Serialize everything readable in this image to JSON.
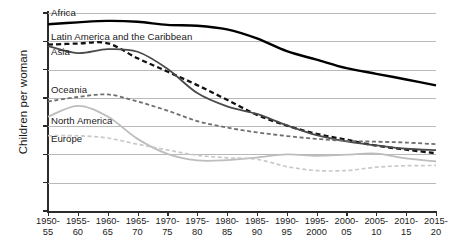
{
  "chart_data": {
    "type": "line",
    "title": "",
    "xlabel": "",
    "ylabel": "Children per woman",
    "ylim": [
      0,
      7
    ],
    "yticks": [
      0,
      1,
      2,
      3,
      4,
      5,
      6,
      7
    ],
    "grid": true,
    "legend_position": "inline-labels",
    "categories": [
      "1950-55",
      "1955-60",
      "1960-65",
      "1965-70",
      "1970-75",
      "1975-80",
      "1980-85",
      "1985-90",
      "1990-95",
      "1995-2000",
      "2000-05",
      "2005-10",
      "2010-15",
      "2015-20"
    ],
    "category_lines": [
      [
        "1950-",
        "55"
      ],
      [
        "1955-",
        "60"
      ],
      [
        "1960-",
        "65"
      ],
      [
        "1965-",
        "70"
      ],
      [
        "1970-",
        "75"
      ],
      [
        "1975-",
        "80"
      ],
      [
        "1980-",
        "85"
      ],
      [
        "1985-",
        "90"
      ],
      [
        "1990-",
        "95"
      ],
      [
        "1995-",
        "2000"
      ],
      [
        "2000-",
        "05"
      ],
      [
        "2005-",
        "10"
      ],
      [
        "2010-",
        "15"
      ],
      [
        "2015-",
        "20"
      ]
    ],
    "series": [
      {
        "name": "Africa",
        "style": "solid",
        "color": "#000000",
        "width": 2.4,
        "values": [
          6.6,
          6.67,
          6.72,
          6.69,
          6.58,
          6.55,
          6.42,
          6.1,
          5.65,
          5.35,
          5.05,
          4.85,
          4.65,
          4.44
        ],
        "label_x": 1,
        "label_y": 6.96
      },
      {
        "name": "Latin America and the Caribbean",
        "style": "dashed",
        "color": "#111111",
        "width": 2.3,
        "values": [
          5.88,
          5.92,
          5.93,
          5.4,
          4.93,
          4.45,
          3.93,
          3.4,
          3.02,
          2.73,
          2.52,
          2.31,
          2.17,
          2.04
        ],
        "label_x": 1,
        "label_y": 6.1
      },
      {
        "name": "Asia",
        "style": "solid",
        "color": "#4a4a4a",
        "width": 1.8,
        "values": [
          5.83,
          5.58,
          5.72,
          5.63,
          5.03,
          4.17,
          3.7,
          3.43,
          3.03,
          2.68,
          2.46,
          2.32,
          2.2,
          2.15
        ],
        "label_x": 1,
        "label_y": 5.58
      },
      {
        "name": "Oceania",
        "style": "dashed",
        "color": "#6f6f6f",
        "width": 1.8,
        "values": [
          3.87,
          4.03,
          4.12,
          3.87,
          3.55,
          3.18,
          2.95,
          2.78,
          2.65,
          2.55,
          2.48,
          2.45,
          2.42,
          2.36
        ],
        "label_x": 1,
        "label_y": 4.26
      },
      {
        "name": "North America",
        "style": "solid",
        "color": "#bdbdbd",
        "width": 1.8,
        "values": [
          3.33,
          3.72,
          3.34,
          2.55,
          2.02,
          1.79,
          1.8,
          1.89,
          2.0,
          1.95,
          1.99,
          2.03,
          1.86,
          1.75
        ],
        "label_x": 1,
        "label_y": 3.13
      },
      {
        "name": "Europe",
        "style": "dashed",
        "color": "#c9c9c9",
        "width": 1.7,
        "values": [
          2.66,
          2.66,
          2.58,
          2.36,
          2.16,
          1.97,
          1.88,
          1.83,
          1.57,
          1.43,
          1.43,
          1.55,
          1.6,
          1.61
        ],
        "label_x": 1,
        "label_y": 2.5
      }
    ]
  }
}
